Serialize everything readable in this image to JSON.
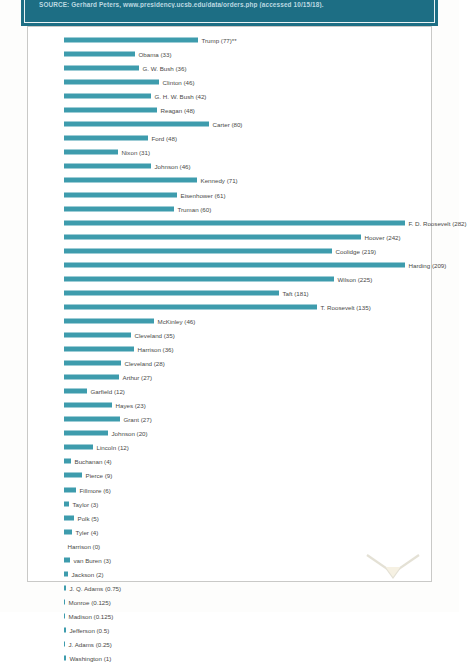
{
  "source_banner": {
    "text": "SOURCE: Gerhard Peters, www.presidency.ucsb.edu/data/orders.php (accessed 10/15/18).",
    "background_color": "#1d6e84",
    "text_color": "#bcd9e1"
  },
  "chart_data": {
    "type": "bar",
    "orientation": "horizontal",
    "title": "",
    "xlabel": "",
    "ylabel": "",
    "grid": false,
    "legend": false,
    "bar_color": "#3e9cad",
    "note": "Bar lengths encode total executive orders issued; the parenthetical number in each label is the average number of executive orders per year.",
    "categories": [
      "Trump",
      "Obama",
      "G. W. Bush",
      "Clinton",
      "G. H. W. Bush",
      "Reagan",
      "Carter",
      "Ford",
      "Nixon",
      "Johnson",
      "Kennedy",
      "Eisenhower",
      "Truman",
      "F. D. Roosevelt",
      "Hoover",
      "Coolidge",
      "Harding",
      "Wilson",
      "Taft",
      "T. Roosevelt",
      "McKinley",
      "Cleveland",
      "Harrison",
      "Cleveland",
      "Arthur",
      "Garfield",
      "Hayes",
      "Grant",
      "Johnson",
      "Lincoln",
      "Buchanan",
      "Pierce",
      "Fillmore",
      "Taylor",
      "Polk",
      "Tyler",
      "Harrison",
      "van Buren",
      "Jackson",
      "J. Q. Adams",
      "Monroe",
      "Madison",
      "Jefferson",
      "J. Adams",
      "Washington"
    ],
    "labels": [
      "Trump (77)**",
      "Obama (33)",
      "G. W. Bush (36)",
      "Clinton (46)",
      "G. H. W. Bush (42)",
      "Reagan (48)",
      "Carter (80)",
      "Ford (48)",
      "Nixon (31)",
      "Johnson (46)",
      "Kennedy (71)",
      "Eisenhower (61)",
      "Truman (60)",
      "F. D. Roosevelt (282)",
      "Hoover (242)",
      "Coolidge (219)",
      "Harding (209)",
      "Wilson (225)",
      "Taft (181)",
      "T. Roosevelt (135)",
      "McKinley (46)",
      "Cleveland (35)",
      "Harrison (36)",
      "Cleveland (28)",
      "Arthur (27)",
      "Garfield (12)",
      "Hayes (23)",
      "Grant (27)",
      "Johnson (20)",
      "Lincoln (12)",
      "Buchanan (4)",
      "Pierce (9)",
      "Fillmore (6)",
      "Taylor (3)",
      "Polk (5)",
      "Tyler (4)",
      "Harrison (0)",
      "van Buren (3)",
      "Jackson (2)",
      "J. Q. Adams (0.75)",
      "Monroe (0.125)",
      "Madison (0.125)",
      "Jefferson (0.5)",
      "J. Adams (0.25)",
      "Washington (1)"
    ],
    "values": [
      77,
      33,
      36,
      46,
      42,
      48,
      80,
      48,
      31,
      46,
      71,
      61,
      60,
      282,
      242,
      219,
      209,
      225,
      181,
      135,
      46,
      35,
      36,
      28,
      27,
      12,
      23,
      27,
      20,
      12,
      4,
      9,
      6,
      3,
      5,
      4,
      0,
      3,
      2,
      0.75,
      0.125,
      0.125,
      0.5,
      0.25,
      1
    ],
    "bar_lengths_px": [
      134,
      71,
      75,
      95,
      87,
      93,
      145,
      84,
      54,
      87,
      133,
      113,
      110,
      341,
      297,
      268,
      341,
      270,
      215,
      253,
      90,
      67,
      70,
      57,
      55,
      23,
      48,
      56,
      44,
      29,
      7,
      18,
      12,
      5,
      10,
      8,
      0,
      6,
      4,
      2,
      1,
      1,
      2,
      1,
      2
    ]
  }
}
